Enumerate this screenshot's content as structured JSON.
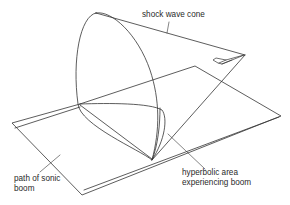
{
  "diagram": {
    "type": "illustration",
    "labels": {
      "shock_wave_cone": "shock wave cone",
      "path_line1": "path of sonic",
      "path_line2": "boom",
      "hyperbolic_line1": "hyperbolic area",
      "hyperbolic_line2": "experiencing boom"
    },
    "elements": [
      "shock-wave-cone",
      "aircraft",
      "ground-plane",
      "sonic-boom-path",
      "hyperbolic-boom-area"
    ],
    "colors": {
      "stroke": "#333333",
      "text": "#2a2a2a",
      "background": "#ffffff"
    }
  }
}
